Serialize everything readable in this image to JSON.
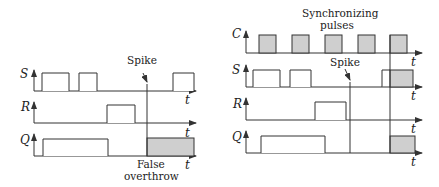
{
  "left_diagram": {
    "signals": [
      {
        "label": "S",
        "axis_label": "t"
      },
      {
        "label": "R",
        "axis_label": "t"
      },
      {
        "label": "Q",
        "axis_label": "t"
      }
    ],
    "annotations": {
      "spike": "Spike",
      "false_line1": "False",
      "false_line2": "overthrow"
    }
  },
  "right_diagram": {
    "title_line1": "Synchronizing",
    "title_line2": "pulses",
    "signals": [
      {
        "label": "C",
        "axis_label": "t"
      },
      {
        "label": "S",
        "axis_label": "t"
      },
      {
        "label": "R",
        "axis_label": "t"
      },
      {
        "label": "Q",
        "axis_label": "t"
      }
    ],
    "annotations": {
      "spike": "Spike"
    }
  },
  "colors": {
    "line": "#333333",
    "shade": "#cfcfcf"
  }
}
